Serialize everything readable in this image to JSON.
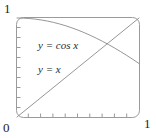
{
  "chart_data": {
    "type": "line",
    "title": "",
    "xlabel": "",
    "ylabel": "",
    "xlim": [
      0,
      1
    ],
    "ylim": [
      0,
      1
    ],
    "grid": false,
    "legend_position": "inline-annotations",
    "frame": "rounded-box",
    "x_ticks": [
      0.1,
      0.2,
      0.3,
      0.4,
      0.5,
      0.6,
      0.7,
      0.8,
      0.9
    ],
    "y_ticks": [
      0.1,
      0.2,
      0.3,
      0.4,
      0.5,
      0.6,
      0.7,
      0.8,
      0.9
    ],
    "axis_corner_labels": {
      "y_max": "1",
      "origin": "0",
      "x_max": "1"
    },
    "annotations": [
      {
        "text": "y = cos x",
        "x": 0.25,
        "y": 0.72
      },
      {
        "text": "y = x",
        "x": 0.25,
        "y": 0.48
      }
    ],
    "intersection": {
      "x": 0.739,
      "y": 0.739
    },
    "series": [
      {
        "name": "y = cos x",
        "color": "#8a8a8a",
        "x": [
          0,
          0.05,
          0.1,
          0.15,
          0.2,
          0.25,
          0.3,
          0.35,
          0.4,
          0.45,
          0.5,
          0.55,
          0.6,
          0.65,
          0.7,
          0.75,
          0.8,
          0.85,
          0.9,
          0.95,
          1
        ],
        "values": [
          1,
          0.9988,
          0.995,
          0.9888,
          0.9801,
          0.9689,
          0.9553,
          0.9394,
          0.9211,
          0.9004,
          0.8776,
          0.8525,
          0.8253,
          0.7961,
          0.7648,
          0.7317,
          0.6967,
          0.66,
          0.6216,
          0.5817,
          0.5403
        ]
      },
      {
        "name": "y = x",
        "color": "#8a8a8a",
        "x": [
          0,
          1
        ],
        "values": [
          0,
          1
        ]
      }
    ]
  },
  "labels": {
    "y_max": "1",
    "origin": "0",
    "x_max": "1",
    "cos_curve": "y = cos x",
    "identity_curve": "y = x"
  },
  "colors": {
    "curve": "#8a8a8a",
    "frame": "#9a9a9a",
    "tick": "#9a9a9a",
    "text": "#222222",
    "background": "#ffffff"
  }
}
